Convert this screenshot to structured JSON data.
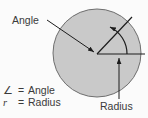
{
  "figure": {
    "colors": {
      "background": "#fbfbfb",
      "circle_fill": "#c9c9c9",
      "circle_stroke": "#6e6e6e",
      "line": "#1c1c1c",
      "text": "#3a3a3a"
    },
    "labels": {
      "angle": "Angle",
      "radius": "Radius"
    },
    "legend": [
      {
        "symbol": "∠",
        "equals": "=",
        "meaning": "Angle",
        "italic": false
      },
      {
        "symbol": "r",
        "equals": "=",
        "meaning": "Radius",
        "italic": true
      }
    ],
    "geometry": {
      "circle_center_x": 97,
      "circle_center_y": 53,
      "circle_radius": 44,
      "vertex_x": 97,
      "vertex_y": 54,
      "horizontal_radius_end_x": 144,
      "horizontal_radius_end_y": 54,
      "angled_radius_end_x": 131,
      "angled_radius_end_y": 17,
      "arc_radius": 30,
      "angle_degrees": 71
    }
  }
}
